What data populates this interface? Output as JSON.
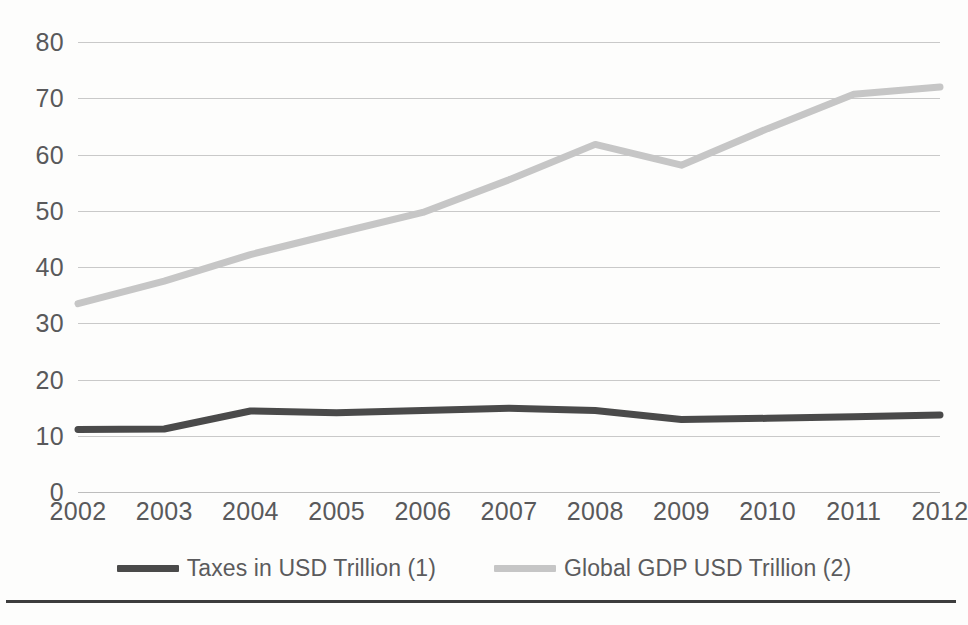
{
  "chart_data": {
    "type": "line",
    "title": "",
    "subtitle": "",
    "xlabel": "",
    "ylabel": "",
    "x": [
      2002,
      2003,
      2004,
      2005,
      2006,
      2007,
      2008,
      2009,
      2010,
      2011,
      2012
    ],
    "categories": [
      "2002",
      "2003",
      "2004",
      "2005",
      "2006",
      "2007",
      "2008",
      "2009",
      "2010",
      "2011",
      "2012"
    ],
    "series": [
      {
        "name": "Taxes in USD Trillion (1)",
        "color": "#4a4a4a",
        "values": [
          11.1,
          11.2,
          14.4,
          14.1,
          14.5,
          14.9,
          14.5,
          12.9,
          13.1,
          13.4,
          13.7
        ]
      },
      {
        "name": "Global GDP USD Trillion (2)",
        "color": "#c6c6c6",
        "values": [
          33.5,
          37.5,
          42.2,
          46.0,
          49.7,
          55.5,
          61.8,
          58.1,
          64.6,
          70.7,
          72.0
        ]
      }
    ],
    "ylim": [
      0,
      80
    ],
    "yticks": [
      0,
      10,
      20,
      30,
      40,
      50,
      60,
      70,
      80
    ],
    "ytick_labels": [
      "0",
      "10",
      "20",
      "30",
      "40",
      "50",
      "60",
      "70",
      "80"
    ],
    "xlim": [
      2002,
      2012
    ],
    "grid": "horizontal",
    "legend_position": "bottom",
    "annotations": []
  },
  "legend": {
    "items": [
      {
        "label": "Taxes in USD Trillion (1)",
        "color": "#4a4a4a"
      },
      {
        "label": "Global GDP USD Trillion (2)",
        "color": "#c6c6c6"
      }
    ]
  },
  "footer": {
    "rule": true,
    "caption": ""
  }
}
